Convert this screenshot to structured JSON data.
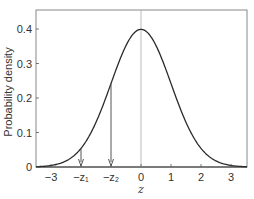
{
  "chart_data": {
    "type": "line",
    "title": "",
    "xlabel": "z",
    "ylabel": "Probability density",
    "xlim": [
      -3.5,
      3.5
    ],
    "ylim": [
      0,
      0.45
    ],
    "grid": false,
    "legend": null,
    "x_ticks": [
      {
        "value": -3,
        "label": "−3"
      },
      {
        "value": -2,
        "label": "−z₁"
      },
      {
        "value": -1,
        "label": "−z₂"
      },
      {
        "value": 0,
        "label": "0"
      },
      {
        "value": 1,
        "label": "1"
      },
      {
        "value": 2,
        "label": "2"
      },
      {
        "value": 3,
        "label": "3"
      }
    ],
    "y_ticks": [
      {
        "value": 0,
        "label": "0"
      },
      {
        "value": 0.1,
        "label": "0.1"
      },
      {
        "value": 0.2,
        "label": "0.2"
      },
      {
        "value": 0.3,
        "label": "0.3"
      },
      {
        "value": 0.4,
        "label": "0.4"
      }
    ],
    "series": [
      {
        "name": "Standard normal density",
        "x": [
          -3.5,
          -3.0,
          -2.5,
          -2.0,
          -1.5,
          -1.0,
          -0.5,
          0,
          0.5,
          1.0,
          1.5,
          2.0,
          2.5,
          3.0,
          3.5
        ],
        "y": [
          0.0009,
          0.0044,
          0.0175,
          0.054,
          0.1295,
          0.242,
          0.3521,
          0.3989,
          0.3521,
          0.242,
          0.1295,
          0.054,
          0.0175,
          0.0044,
          0.0009
        ]
      }
    ],
    "annotations": [
      {
        "type": "vline",
        "x": 0,
        "style": "thin gray reference line"
      },
      {
        "type": "arrow",
        "label": "−z₁",
        "x": -2.0,
        "from_y": 0.054,
        "to_y": 0
      },
      {
        "type": "arrow",
        "label": "−z₂",
        "x": -1.0,
        "from_y": 0.242,
        "to_y": 0
      }
    ],
    "colors": {
      "curve": "#2a2a2a",
      "frame": "#888888",
      "zero_line": "#aaaaaa",
      "arrow": "#555555"
    }
  }
}
